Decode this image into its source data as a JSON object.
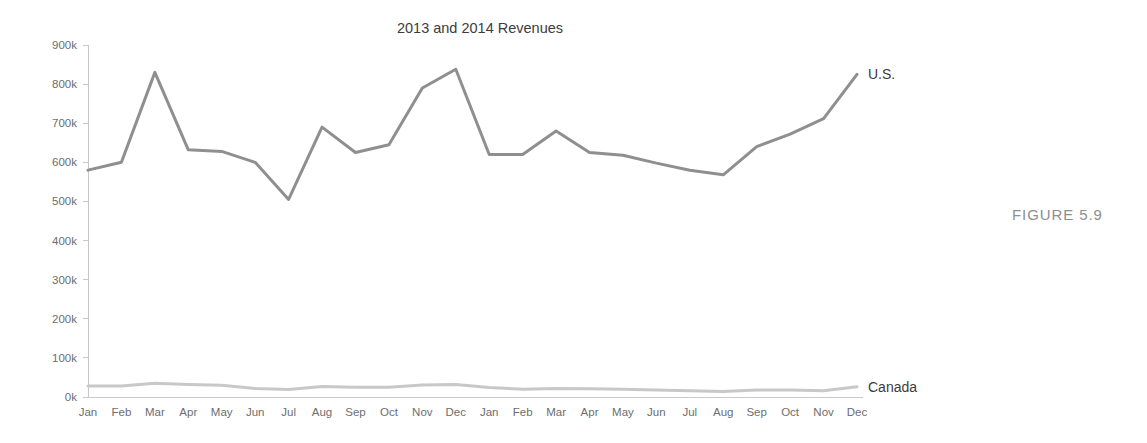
{
  "figure": {
    "caption": "FIGURE 5.9"
  },
  "chart_data": {
    "type": "line",
    "title": "2013 and 2014 Revenues",
    "xlabel": "",
    "ylabel": "",
    "ylim": [
      0,
      900000
    ],
    "ytick_values": [
      0,
      100000,
      200000,
      300000,
      400000,
      500000,
      600000,
      700000,
      800000,
      900000
    ],
    "ytick_labels": [
      "0k",
      "100k",
      "200k",
      "300k",
      "400k",
      "500k",
      "600k",
      "700k",
      "800k",
      "900k"
    ],
    "categories": [
      "Jan",
      "Feb",
      "Mar",
      "Apr",
      "May",
      "Jun",
      "Jul",
      "Aug",
      "Sep",
      "Oct",
      "Nov",
      "Dec",
      "Jan",
      "Feb",
      "Mar",
      "Apr",
      "May",
      "Jun",
      "Jul",
      "Aug",
      "Sep",
      "Oct",
      "Nov",
      "Dec"
    ],
    "grid": false,
    "legend_position": "line-end-labels",
    "series": [
      {
        "name": "U.S.",
        "color": "#8f8f8f",
        "values": [
          580000,
          600000,
          830000,
          632000,
          628000,
          600000,
          505000,
          690000,
          625000,
          645000,
          790000,
          838000,
          620000,
          620000,
          680000,
          625000,
          618000,
          598000,
          580000,
          568000,
          640000,
          672000,
          712000,
          825000
        ]
      },
      {
        "name": "Canada",
        "color": "#c8c8c8",
        "values": [
          28000,
          28000,
          35000,
          32000,
          30000,
          22000,
          19000,
          27000,
          25000,
          25000,
          31000,
          32000,
          24000,
          20000,
          22000,
          21000,
          20000,
          18000,
          16000,
          14000,
          18000,
          18000,
          16000,
          26000
        ]
      }
    ]
  },
  "axis_colors": {
    "axis": "#c9c9c9",
    "tick_label": "#6d6d6d",
    "title": "#3c3c3c",
    "caption": "#8e8e8e"
  }
}
